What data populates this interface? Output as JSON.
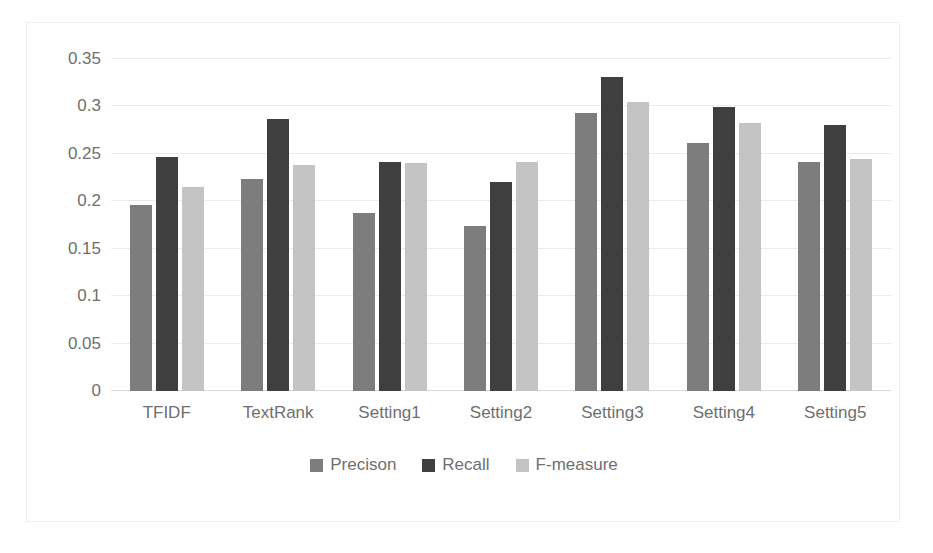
{
  "chart_data": {
    "type": "bar",
    "title": "",
    "subtitle": "",
    "xlabel": "",
    "ylabel": "",
    "categories": [
      "TFIDF",
      "TextRank",
      "Setting1",
      "Setting2",
      "Setting3",
      "Setting4",
      "Setting5"
    ],
    "series": [
      {
        "name": "Precison",
        "color": "#7d7d7d",
        "values": [
          0.196,
          0.224,
          0.188,
          0.174,
          0.293,
          0.261,
          0.241
        ]
      },
      {
        "name": "Recall",
        "color": "#3f3f3f",
        "values": [
          0.247,
          0.287,
          0.241,
          0.22,
          0.331,
          0.299,
          0.28
        ]
      },
      {
        "name": "F-measure",
        "color": "#c4c4c4",
        "values": [
          0.215,
          0.238,
          0.24,
          0.241,
          0.305,
          0.283,
          0.245
        ]
      }
    ],
    "ylim": [
      0,
      0.35
    ],
    "ytick_values": [
      0,
      0.05,
      0.1,
      0.15,
      0.2,
      0.25,
      0.3,
      0.35
    ],
    "ytick_labels": [
      "0",
      "0.05",
      "0.1",
      "0.15",
      "0.2",
      "0.25",
      "0.3",
      "0.35"
    ],
    "grid": true,
    "grid_axis": "y",
    "legend": true,
    "legend_position": "bottom",
    "bar_color_precison": "#7d7d7d",
    "bar_color_recall": "#3f3f3f",
    "bar_color_fmeasure": "#c4c4c4",
    "axis_text_color": "#6f6f6f",
    "gridline_color": "#e8eaec",
    "plot_background": "#ffffff"
  }
}
